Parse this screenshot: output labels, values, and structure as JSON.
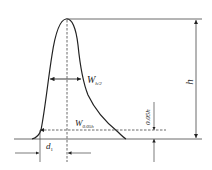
{
  "diagram": {
    "colors": {
      "stroke": "#222222",
      "thin": "#555555",
      "background": "#ffffff"
    },
    "labels": {
      "peak_height": "h",
      "half_width_main": "W",
      "half_width_sub": "h/2",
      "base_width_main": "W",
      "base_width_sub": "0.05h",
      "fraction_height": "0.05h",
      "distance_main": "d",
      "distance_sub": "1"
    }
  }
}
